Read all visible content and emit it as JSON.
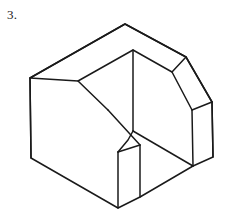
{
  "figure": {
    "label": "3.",
    "caption": "",
    "type": "isometric-line-drawing",
    "colors": {
      "background": "#ffffff",
      "stroke": "#1a1a1a",
      "fill": "#ffffff"
    },
    "stroke_width": 1.5,
    "geometry": {
      "description": "Isometric pictorial view of a C-shaped (U-shaped) solid block whose two forward-projecting arms terminate in angled chamfer cuts.",
      "vertices": {
        "top_back_apex": [
          125,
          24
        ],
        "top_left_corner": [
          30,
          78
        ],
        "left_front_bottom": [
          31,
          158
        ],
        "inner_apex": [
          133,
          50
        ],
        "inner_left_corner": [
          78,
          81
        ],
        "inner_notch_vertex": [
          133,
          131
        ],
        "left_arm_top_outer": [
          108,
          110
        ],
        "left_arm_chamfer_top": [
          140,
          145
        ],
        "left_arm_front_edge_top": [
          118,
          152
        ],
        "left_arm_front_bottom": [
          118,
          208
        ],
        "left_arm_right_bottom": [
          140,
          197
        ],
        "left_base_bottom_corner": [
          31,
          158
        ],
        "right_arm_bend_top": [
          186,
          57
        ],
        "right_arm_inner_bend": [
          172,
          72
        ],
        "right_arm_chamfer_outer": [
          212,
          102
        ],
        "right_arm_front_top": [
          192,
          110
        ],
        "right_arm_front_bottom": [
          193,
          166
        ],
        "right_arm_outer_bottom": [
          213,
          157
        ]
      },
      "faces": [
        "top-face",
        "left-front-face",
        "left-arm-chamfer-face",
        "left-arm-front-face",
        "inner-notch-face",
        "right-arm-chamfer-face",
        "right-arm-front-face"
      ],
      "paths": {
        "outline": "M 30 78 L 125 24 L 186 57 L 212 102 L 213 157 L 193 166 L 140 197 L 118 208 L 31 158 Z",
        "top_face": "M 30 78 L 125 24 L 186 57 L 172 72 L 133 50 L 78 81 Z",
        "inner_notch": "M 133 50 L 133 131 L 193 166 L 213 157 L 212 102 L 186 57 L 172 72 Z",
        "left_arm_chamfer": "M 78 81 L 108 110 L 140 145 L 118 152 Z",
        "left_arm_front": "M 118 152 L 140 145 L 140 197 L 118 208 Z",
        "right_arm_chamfer": "M 172 72 L 212 102 L 192 110 Z",
        "right_arm_front": "M 192 110 L 212 102 L 213 157 L 193 166 Z",
        "left_front_face": "M 30 78 L 78 81 L 108 110 L 118 152 L 118 208 L 31 158 Z",
        "inner_vertical_edge": "M 133 50 L 133 131",
        "inner_diagonal_edge": "M 133 131 L 193 166",
        "notch_lower_edge": "M 133 131 L 128 140 L 118 152",
        "left_arm_edge_a": "M 78 81 L 108 110",
        "left_arm_edge_b": "M 108 110 L 140 145",
        "left_arm_edge_c": "M 118 152 L 140 145",
        "left_arm_vertical": "M 118 152 L 118 208",
        "left_arm_right_vertical": "M 140 145 L 140 197",
        "right_arm_edge_a": "M 172 72 L 192 110",
        "right_arm_edge_b": "M 186 57 L 212 102",
        "right_arm_edge_c": "M 192 110 L 212 102",
        "right_arm_vertical": "M 192 110 L 193 166",
        "right_arm_right_vertical": "M 212 102 L 213 157",
        "left_vertical": "M 30 78 L 31 158"
      }
    }
  }
}
